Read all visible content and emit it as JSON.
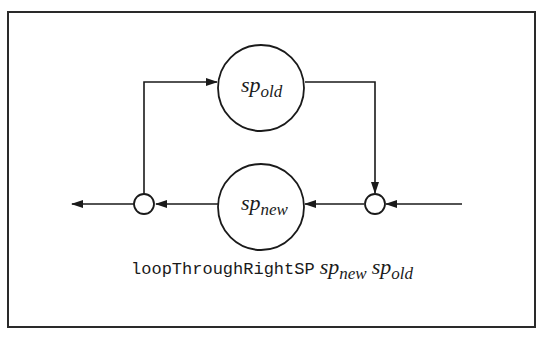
{
  "diagram": {
    "nodes": [
      {
        "id": "sp_old",
        "label_base": "sp",
        "label_sub": "old",
        "shape": "circle",
        "position": "top"
      },
      {
        "id": "sp_new",
        "label_base": "sp",
        "label_sub": "new",
        "shape": "circle",
        "position": "bottom"
      },
      {
        "id": "junction_left",
        "shape": "small-circle"
      },
      {
        "id": "junction_right",
        "shape": "small-circle"
      }
    ],
    "edges": [
      {
        "from": "input",
        "to": "junction_right"
      },
      {
        "from": "junction_right",
        "to": "sp_new"
      },
      {
        "from": "sp_new",
        "to": "junction_left"
      },
      {
        "from": "junction_left",
        "to": "output"
      },
      {
        "from": "junction_left",
        "to": "sp_old"
      },
      {
        "from": "sp_old",
        "to": "junction_right"
      }
    ],
    "caption": {
      "function": "loopThroughRightSP",
      "arg1_base": "sp",
      "arg1_sub": "new",
      "arg2_base": "sp",
      "arg2_sub": "old"
    },
    "colors": {
      "stroke": "#1a1a1a",
      "background": "#ffffff"
    }
  }
}
